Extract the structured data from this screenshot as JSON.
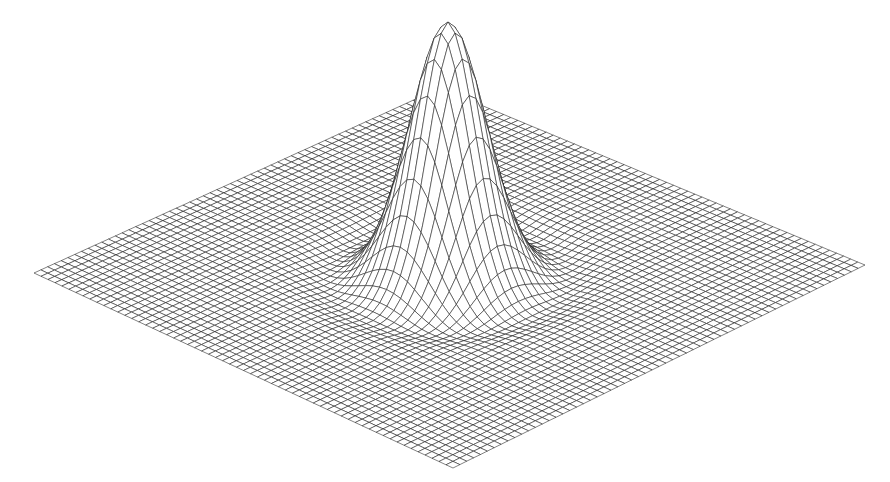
{
  "chart_data": {
    "type": "surface-wireframe",
    "title": "",
    "xlabel": "",
    "ylabel": "",
    "zlabel": "",
    "grid": true,
    "legend": null,
    "mesh": {
      "rows": 60,
      "cols": 60,
      "x_range": [
        -1,
        1
      ],
      "y_range": [
        -1,
        1
      ],
      "surface_function": "z = A*exp(-(x^2+y^2)/(2*s^2)) - d*exp(-(r-r0)^2/(2*w^2))",
      "peak_amplitude": 1.0,
      "sigma": 0.13,
      "ring_dip_depth": 0.03,
      "ring_radius": 0.38,
      "ring_width": 0.08
    },
    "projection": {
      "left_corner_px": [
        34,
        273
      ],
      "back_corner_px": [
        440,
        88
      ],
      "right_corner_px": [
        865,
        265
      ],
      "front_corner_px": [
        453,
        468
      ],
      "peak_apex_px": [
        446,
        22
      ]
    },
    "colors": {
      "background": "#ffffff",
      "line": "#1a1a1a",
      "fill": "#ffffff"
    }
  }
}
